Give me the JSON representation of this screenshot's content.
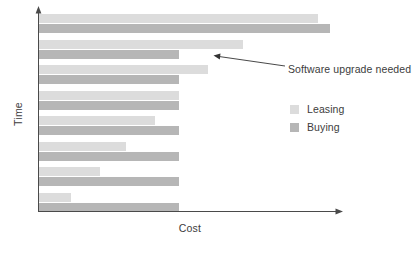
{
  "chart_data": {
    "type": "bar",
    "orientation": "horizontal",
    "title": "",
    "subtitle": "",
    "xlabel": "Cost",
    "ylabel": "Time",
    "grid": false,
    "axis_ticks": false,
    "xlim": [
      0,
      100
    ],
    "legend_position": "right",
    "categories": [
      "1",
      "2",
      "3",
      "4",
      "5",
      "6",
      "7",
      "8"
    ],
    "series": [
      {
        "name": "Leasing",
        "color": "#dcdcdc",
        "values": [
          96,
          70,
          58,
          48,
          40,
          30,
          21,
          11
        ]
      },
      {
        "name": "Buying",
        "color": "#b6b6b6",
        "values": [
          100,
          48,
          48,
          48,
          48,
          48,
          48,
          48
        ]
      }
    ],
    "annotations": [
      {
        "text": "Software upgrade needed",
        "target_series": "Buying",
        "target_category": "2"
      }
    ]
  },
  "axes": {
    "x_title": "Cost",
    "y_title": "Time"
  },
  "legend": {
    "items": [
      {
        "label": "Leasing",
        "swatch_color": "#dcdcdc",
        "swatch_icon": "legend-swatch-icon"
      },
      {
        "label": "Buying",
        "swatch_color": "#b6b6b6",
        "swatch_icon": "legend-swatch-icon"
      }
    ]
  },
  "annotation": {
    "text": "Software upgrade needed"
  },
  "style": {
    "axis_color": "#4a4a4a",
    "text_color": "#3c3c3c",
    "leasing_color": "#dcdcdc",
    "buying_color": "#b6b6b6",
    "background": "#ffffff"
  }
}
